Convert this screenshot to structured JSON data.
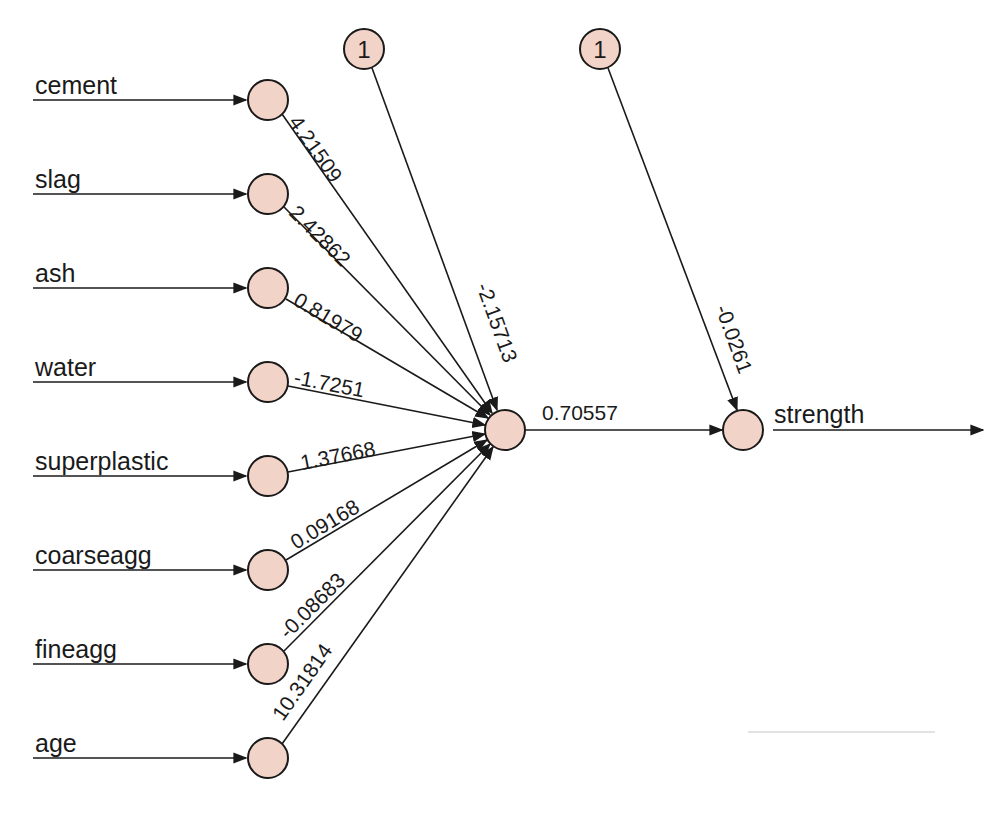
{
  "diagram": {
    "type": "neural-network",
    "node_fill": "#f2d3c8",
    "stroke_color": "#1a1a1a",
    "inputs": [
      {
        "label": "cement",
        "weight": "4.21509"
      },
      {
        "label": "slag",
        "weight": "2.42862"
      },
      {
        "label": "ash",
        "weight": "0.81979"
      },
      {
        "label": "water",
        "weight": "-1.7251"
      },
      {
        "label": "superplastic",
        "weight": "1.37668"
      },
      {
        "label": "coarseagg",
        "weight": "0.09168"
      },
      {
        "label": "fineagg",
        "weight": "-0.08683"
      },
      {
        "label": "age",
        "weight": "10.31814"
      }
    ],
    "bias_hidden": {
      "label": "1",
      "weight": "-2.15713"
    },
    "bias_output": {
      "label": "1",
      "weight": "-0.0261"
    },
    "hidden_to_output": {
      "weight": "0.70557"
    },
    "output": {
      "label": "strength"
    }
  }
}
